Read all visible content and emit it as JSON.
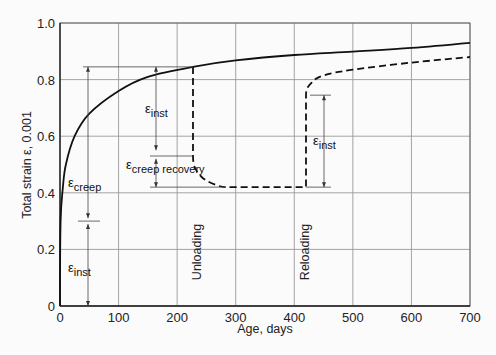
{
  "chart_data": {
    "type": "line",
    "title": "",
    "xlabel": "Age, days",
    "ylabel": "Total strain ε, 0.001",
    "xlim": [
      0,
      700
    ],
    "ylim": [
      0,
      1.0
    ],
    "x_ticks": [
      "0",
      "100",
      "200",
      "300",
      "400",
      "500",
      "600",
      "700"
    ],
    "y_ticks": [
      "0",
      "0.2",
      "0.4",
      "0.6",
      "0.8",
      "1.0"
    ],
    "grid": true,
    "legend": null,
    "series": [
      {
        "name": "Sustained load (solid)",
        "style": "solid",
        "points": [
          [
            0,
            0
          ],
          [
            1,
            0.3
          ],
          [
            5,
            0.42
          ],
          [
            10,
            0.5
          ],
          [
            25,
            0.6
          ],
          [
            50,
            0.68
          ],
          [
            100,
            0.76
          ],
          [
            150,
            0.81
          ],
          [
            227,
            0.845
          ],
          [
            300,
            0.868
          ],
          [
            400,
            0.887
          ],
          [
            500,
            0.899
          ],
          [
            600,
            0.912
          ],
          [
            700,
            0.93
          ]
        ]
      },
      {
        "name": "Unloading / reloading (dashed)",
        "style": "dashed",
        "points": [
          [
            227,
            0.845
          ],
          [
            227,
            0.53
          ],
          [
            240,
            0.46
          ],
          [
            270,
            0.425
          ],
          [
            300,
            0.42
          ],
          [
            420,
            0.42
          ],
          [
            420,
            0.745
          ],
          [
            430,
            0.79
          ],
          [
            450,
            0.815
          ],
          [
            500,
            0.835
          ],
          [
            600,
            0.86
          ],
          [
            700,
            0.88
          ]
        ]
      }
    ],
    "annotations": [
      {
        "text_main": "ε",
        "text_sub": "inst",
        "note": "instantaneous strain on loading (0 to 0.3)"
      },
      {
        "text_main": "ε",
        "text_sub": "creep",
        "note": "creep strain (0.3 to 0.845)"
      },
      {
        "text_main": "ε",
        "text_sub": "inst",
        "note": "instantaneous recovery at unloading (0.845 to 0.53)"
      },
      {
        "text_main": "ε",
        "text_sub": "creep recovery",
        "note": "creep recovery (0.53 to 0.42)"
      },
      {
        "text_main": "ε",
        "text_sub": "inst",
        "note": "instantaneous strain at reloading (0.42 to 0.745)"
      },
      {
        "text": "Unloading",
        "x": 227
      },
      {
        "text": "Reloading",
        "x": 420
      }
    ]
  },
  "labels": {
    "xlabel": "Age, days",
    "ylabel": "Total strain ε, 0.001",
    "eps": "ε",
    "inst": "inst",
    "creep": "creep",
    "creep_recovery": "creep recovery",
    "unloading": "Unloading",
    "reloading": "Reloading"
  }
}
